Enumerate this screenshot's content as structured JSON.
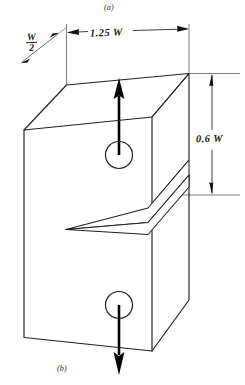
{
  "figure": {
    "type": "isometric-engineering-drawing",
    "captions": {
      "top": "(a)",
      "bottom": "(b)"
    },
    "dimensions": [
      {
        "id": "depth",
        "label_numerator": "W",
        "label_denominator": "2",
        "text": "W/2",
        "orientation": "diagonal-isometric",
        "location": "top-left-edge"
      },
      {
        "id": "width",
        "text": "1.25 W",
        "orientation": "diagonal-isometric",
        "location": "top-back-edge"
      },
      {
        "id": "height",
        "text": "0.6 W",
        "orientation": "vertical",
        "location": "right-side"
      }
    ],
    "features": {
      "upper_hole": {
        "shape": "circle",
        "force_arrow": "up"
      },
      "lower_hole": {
        "shape": "circle",
        "force_arrow": "down"
      },
      "crack": {
        "shape": "edge-crack-with-pointed-tip",
        "location": "mid-height"
      }
    },
    "colors": {
      "line": "#231f20",
      "arrow": "#000000",
      "background": "#ffffff",
      "dimension_line": "#3a3637"
    }
  }
}
